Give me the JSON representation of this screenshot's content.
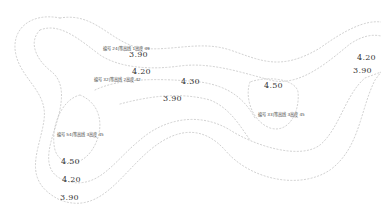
{
  "map": {
    "type": "contour_map",
    "stroke_color": "#c4c4c4",
    "text_color": "#333333",
    "elevation_labels": [
      {
        "text": "3.90",
        "x": 129,
        "y": 55
      },
      {
        "text": "4.20",
        "x": 132,
        "y": 72
      },
      {
        "text": "4.30",
        "x": 181,
        "y": 82
      },
      {
        "text": "3.90",
        "x": 163,
        "y": 99
      },
      {
        "text": "4.50",
        "x": 264,
        "y": 86
      },
      {
        "text": "4.20",
        "x": 357,
        "y": 58
      },
      {
        "text": "3.90",
        "x": 353,
        "y": 71
      },
      {
        "text": "4.50",
        "x": 61,
        "y": 162
      },
      {
        "text": "4.20",
        "x": 62,
        "y": 180
      },
      {
        "text": "3.90",
        "x": 60,
        "y": 198
      }
    ],
    "notes": [
      {
        "text": "编号 24|等高线 1高度 39",
        "x": 103,
        "y": 50
      },
      {
        "text": "编号 32|等高线 2高度 42",
        "x": 94,
        "y": 81
      },
      {
        "text": "编号 54|等高线 3高度 45",
        "x": 57,
        "y": 136
      },
      {
        "text": "编号 33|等高线 3高度 45",
        "x": 258,
        "y": 116
      }
    ]
  }
}
